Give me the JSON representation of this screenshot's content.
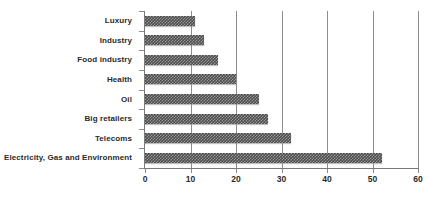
{
  "chart_data": {
    "type": "bar",
    "orientation": "horizontal",
    "title": "",
    "xlabel": "",
    "ylabel": "",
    "categories": [
      "Luxury",
      "Industry",
      "Food industry",
      "Health",
      "Oil",
      "Big retailers",
      "Telecoms",
      "Electricity, Gas and Environment"
    ],
    "values": [
      11,
      13,
      16,
      20,
      25,
      27,
      32,
      52
    ],
    "xlim": [
      0,
      60
    ],
    "xticks": [
      0,
      10,
      20,
      30,
      40,
      50,
      60
    ],
    "xtick_labels": [
      "0",
      "10",
      "20",
      "30",
      "40",
      "50",
      "60"
    ],
    "grid": "vertical",
    "legend": "none",
    "bar_color": "#4d4d4d",
    "bar_pattern": "checkered-texture",
    "axis_color": "#7a7a7a",
    "gridline_color": "#8c8c8c",
    "text_color": "#2b2b2b",
    "background_color": "#ffffff"
  }
}
